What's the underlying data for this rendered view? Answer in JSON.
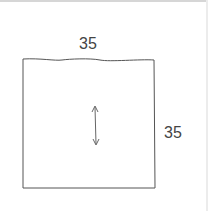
{
  "diagram": {
    "type": "pattern-piece",
    "shape": "square",
    "width_label": "35",
    "height_label": "35",
    "grainline": "vertical double-headed arrow",
    "stroke_color": "#555555"
  }
}
